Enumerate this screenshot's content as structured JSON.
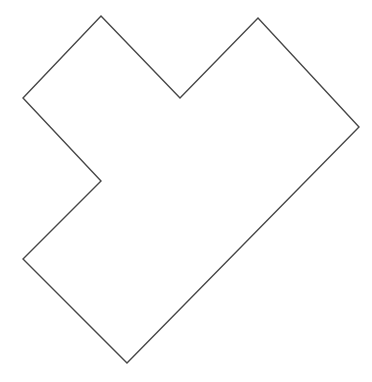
{
  "canvas": {
    "width": 372,
    "height": 382,
    "background_color": "#ffffff"
  },
  "shape": {
    "description": "concave heart-like polygon outline with two top peaks, a top valley, a left notch, and a bottom point",
    "stroke_color": "#474747",
    "stroke_width": 1.4,
    "fill": "none",
    "points": [
      [
        101,
        16
      ],
      [
        180,
        98
      ],
      [
        258,
        18
      ],
      [
        359,
        127
      ],
      [
        127,
        363
      ],
      [
        23,
        259
      ],
      [
        101,
        181
      ],
      [
        23,
        98
      ]
    ],
    "points_str": "101,16 180,98 258,18 359,127 127,363 23,259 101,181 23,98"
  }
}
